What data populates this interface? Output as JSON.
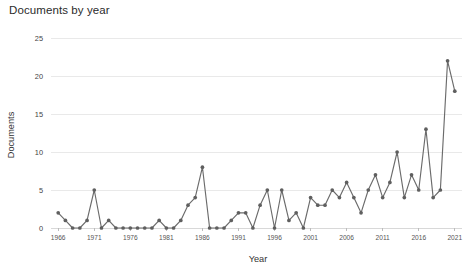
{
  "chart_data": {
    "type": "line",
    "title": "Documents by year",
    "xlabel": "Year",
    "ylabel": "Documents",
    "grid": true,
    "legend": false,
    "marker": "circle",
    "line_color": "#6b6b6b",
    "marker_color": "#5f5f5f",
    "grid_color": "#e9e9e9",
    "xlim": [
      1965,
      2022
    ],
    "ylim": [
      0,
      25
    ],
    "y_ticks": [
      0,
      5,
      10,
      15,
      20,
      25
    ],
    "x_ticks": [
      1966,
      1971,
      1976,
      1981,
      1986,
      1991,
      1996,
      2001,
      2006,
      2011,
      2016,
      2021
    ],
    "x": [
      1966,
      1967,
      1968,
      1969,
      1970,
      1971,
      1972,
      1973,
      1974,
      1975,
      1976,
      1977,
      1978,
      1979,
      1980,
      1981,
      1982,
      1983,
      1984,
      1985,
      1986,
      1987,
      1988,
      1989,
      1990,
      1991,
      1992,
      1993,
      1994,
      1995,
      1996,
      1997,
      1998,
      1999,
      2000,
      2001,
      2002,
      2003,
      2004,
      2005,
      2006,
      2007,
      2008,
      2009,
      2010,
      2011,
      2012,
      2013,
      2014,
      2015,
      2016,
      2017,
      2018,
      2019,
      2020,
      2021
    ],
    "values": [
      2,
      1,
      0,
      0,
      1,
      5,
      0,
      1,
      0,
      0,
      0,
      0,
      0,
      0,
      1,
      0,
      0,
      1,
      3,
      4,
      8,
      0,
      0,
      0,
      1,
      2,
      2,
      0,
      3,
      5,
      0,
      5,
      1,
      2,
      0,
      4,
      3,
      3,
      5,
      4,
      6,
      4,
      2,
      5,
      7,
      4,
      6,
      10,
      4,
      7,
      5,
      13,
      4,
      5,
      22,
      18
    ],
    "series": [
      {
        "name": "Documents",
        "values": [
          2,
          1,
          0,
          0,
          1,
          5,
          0,
          1,
          0,
          0,
          0,
          0,
          0,
          0,
          1,
          0,
          0,
          1,
          3,
          4,
          8,
          0,
          0,
          0,
          1,
          2,
          2,
          0,
          3,
          5,
          0,
          5,
          1,
          2,
          0,
          4,
          3,
          3,
          5,
          4,
          6,
          4,
          2,
          5,
          7,
          4,
          6,
          10,
          4,
          7,
          5,
          13,
          4,
          5,
          22,
          18
        ]
      }
    ]
  },
  "axis": {
    "y_tick_labels": [
      "0",
      "5",
      "10",
      "15",
      "20",
      "25"
    ],
    "x_tick_labels": [
      "1966",
      "1971",
      "1976",
      "1981",
      "1986",
      "1991",
      "1996",
      "2001",
      "2006",
      "2011",
      "2016",
      "2021"
    ]
  }
}
